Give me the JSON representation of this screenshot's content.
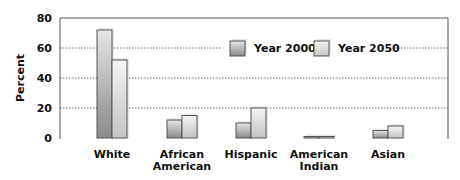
{
  "chart_data": {
    "type": "bar",
    "title": "",
    "xlabel": "",
    "ylabel": "Percent",
    "ylim": [
      0,
      80
    ],
    "yticks": [
      0,
      20,
      40,
      60,
      80
    ],
    "grid": "dotted horizontal at 20, 40, 60",
    "legend_position": "top-right inside plot",
    "categories": [
      "White",
      "African American",
      "Hispanic",
      "American Indian",
      "Asian"
    ],
    "category_label_lines": [
      [
        "White"
      ],
      [
        "African",
        "American"
      ],
      [
        "Hispanic"
      ],
      [
        "American",
        "Indian"
      ],
      [
        "Asian"
      ]
    ],
    "series": [
      {
        "name": "Year 2000",
        "values": [
          72,
          12,
          10,
          1,
          5
        ],
        "color": "#9a9a9a"
      },
      {
        "name": "Year 2050",
        "values": [
          52,
          15,
          20,
          1,
          8
        ],
        "color": "#d6d6d6"
      }
    ]
  }
}
